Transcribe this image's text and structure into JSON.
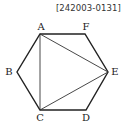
{
  "problem_code": "[242003-0131]",
  "diagram": {
    "type": "regular hexagon with inscribed triangle",
    "vertices": [
      {
        "label": "A",
        "x": 40,
        "y": 34,
        "lx": 41,
        "ly": 30
      },
      {
        "label": "F",
        "x": 85,
        "y": 34,
        "lx": 86,
        "ly": 30
      },
      {
        "label": "E",
        "x": 108,
        "y": 72,
        "lx": 115,
        "ly": 75
      },
      {
        "label": "D",
        "x": 86,
        "y": 110,
        "lx": 86,
        "ly": 121
      },
      {
        "label": "C",
        "x": 40,
        "y": 110,
        "lx": 40,
        "ly": 121
      },
      {
        "label": "B",
        "x": 17,
        "y": 72,
        "lx": 9,
        "ly": 75
      }
    ],
    "hexagon_order": [
      "A",
      "F",
      "E",
      "D",
      "C",
      "B"
    ],
    "diagonals": [
      [
        "A",
        "C"
      ],
      [
        "A",
        "E"
      ],
      [
        "C",
        "E"
      ]
    ],
    "stroke_color": "#222222"
  }
}
